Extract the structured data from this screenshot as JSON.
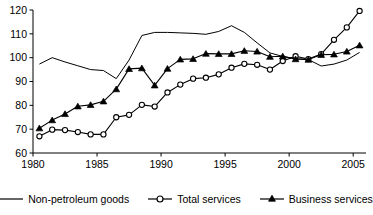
{
  "chart_data": {
    "type": "line",
    "title": "",
    "subtitle": "",
    "xlabel": "",
    "ylabel": "",
    "xlim": [
      1980,
      2006
    ],
    "ylim": [
      60,
      120
    ],
    "grid": false,
    "legend_position": "bottom",
    "x_ticks": [
      "1980",
      "1985",
      "1990",
      "1995",
      "2000",
      "2005"
    ],
    "x_tick_values": [
      1980,
      1985,
      1990,
      1995,
      2000,
      2005
    ],
    "y_ticks": [
      "60",
      "70",
      "80",
      "90",
      "100",
      "110",
      "120"
    ],
    "y_tick_values": [
      60,
      70,
      80,
      90,
      100,
      110,
      120
    ],
    "x": [
      1980.5,
      1981.5,
      1982.5,
      1983.5,
      1984.5,
      1985.5,
      1986.5,
      1987.5,
      1988.5,
      1989.5,
      1990.5,
      1991.5,
      1992.5,
      1993.5,
      1994.5,
      1995.5,
      1996.5,
      1997.5,
      1998.5,
      1999.5,
      2000.5,
      2001.5,
      2002.5,
      2003.5,
      2004.5,
      2005.5
    ],
    "series": [
      {
        "name": "Non-petroleum goods",
        "marker": "none",
        "color": "#000000",
        "values": [
          97.3,
          100.0,
          98.2,
          96.6,
          95.0,
          94.6,
          91.2,
          99.0,
          109.3,
          110.6,
          110.6,
          110.4,
          110.2,
          109.8,
          111.0,
          113.4,
          110.6,
          106.2,
          102.0,
          100.5,
          99.6,
          99.2,
          96.5,
          97.3,
          99.0,
          102.2
        ]
      },
      {
        "name": "Total services",
        "marker": "open-circle",
        "color": "#000000",
        "values": [
          67.0,
          69.8,
          69.6,
          68.8,
          67.8,
          67.8,
          75.0,
          76.0,
          80.2,
          79.5,
          85.4,
          88.7,
          91.2,
          91.6,
          93.0,
          95.8,
          97.4,
          97.0,
          95.0,
          98.6,
          100.6,
          99.4,
          101.5,
          107.5,
          112.7,
          119.6
        ]
      },
      {
        "name": "Business services",
        "marker": "filled-triangle",
        "color": "#000000",
        "values": [
          70.4,
          73.8,
          76.4,
          79.6,
          80.2,
          81.7,
          86.8,
          95.3,
          95.6,
          88.4,
          95.4,
          99.3,
          99.5,
          101.7,
          101.6,
          101.6,
          102.9,
          102.6,
          100.4,
          100.6,
          99.4,
          99.2,
          101.2,
          101.4,
          102.6,
          105.2
        ]
      }
    ]
  },
  "legend": {
    "items": [
      {
        "label": "Non-petroleum goods",
        "marker": "none"
      },
      {
        "label": "Total services",
        "marker": "open-circle"
      },
      {
        "label": "Business services",
        "marker": "filled-triangle"
      }
    ]
  },
  "axes": {
    "y_label_0": "60",
    "y_label_1": "70",
    "y_label_2": "80",
    "y_label_3": "90",
    "y_label_4": "100",
    "y_label_5": "110",
    "y_label_6": "120",
    "x_label_0": "1980",
    "x_label_1": "1985",
    "x_label_2": "1990",
    "x_label_3": "1995",
    "x_label_4": "2000",
    "x_label_5": "2005"
  },
  "colors": {
    "line": "#000000",
    "axis": "#000000",
    "background": "#ffffff"
  }
}
